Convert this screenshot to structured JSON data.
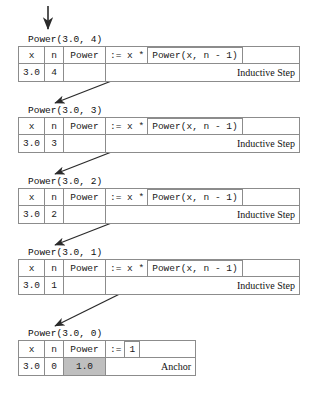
{
  "diagram": {
    "columns": [
      "x",
      "n",
      "Power"
    ],
    "entry_arrow": {
      "name": "entry-arrow",
      "direction": "down"
    },
    "frames": [
      {
        "call_label": "Power(3.0, 4)",
        "x": "3.0",
        "n": "4",
        "power": "",
        "operator": ":= x *",
        "expression": "Power(x, n - 1)",
        "tag": "Inductive Step",
        "kind": "inductive"
      },
      {
        "call_label": "Power(3.0, 3)",
        "x": "3.0",
        "n": "3",
        "power": "",
        "operator": ":= x *",
        "expression": "Power(x, n - 1)",
        "tag": "Inductive Step",
        "kind": "inductive"
      },
      {
        "call_label": "Power(3.0, 2)",
        "x": "3.0",
        "n": "2",
        "power": "",
        "operator": ":= x *",
        "expression": "Power(x, n - 1)",
        "tag": "Inductive Step",
        "kind": "inductive"
      },
      {
        "call_label": "Power(3.0, 1)",
        "x": "3.0",
        "n": "1",
        "power": "",
        "operator": ":= x *",
        "expression": "Power(x, n - 1)",
        "tag": "Inductive Step",
        "kind": "inductive"
      },
      {
        "call_label": "Power(3.0, 0)",
        "x": "3.0",
        "n": "0",
        "power": "1.0",
        "operator": ":=",
        "expression": "1",
        "tag": "Anchor",
        "kind": "anchor"
      }
    ],
    "colors": {
      "border": "#8c8c8c",
      "shaded_cell": "#bfbfbf",
      "text": "#1a1a1a",
      "arrow": "#2b2b2b",
      "background": "#ffffff"
    }
  }
}
